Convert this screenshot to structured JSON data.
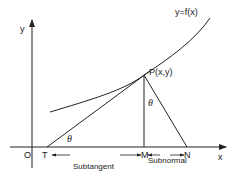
{
  "diagram": {
    "axes": {
      "x_label": "x",
      "y_label": "y",
      "origin_label": "O"
    },
    "curve_label": "y=f(x)",
    "point_label": "P(x,y)",
    "points": {
      "T": "T",
      "M": "M",
      "N": "N"
    },
    "angle_label": "θ",
    "segments": {
      "subtangent": "Subtangent",
      "subnormal": "Subnormal"
    },
    "colors": {
      "line": "#222222",
      "background": "#ffffff"
    }
  }
}
